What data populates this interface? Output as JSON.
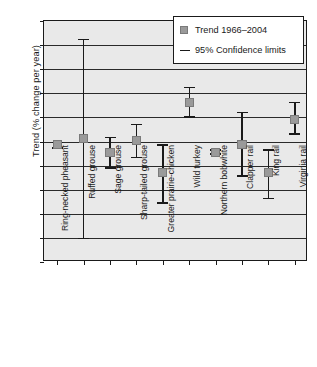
{
  "chart_data": {
    "type": "scatter",
    "title": "",
    "xlabel": "",
    "ylabel": "Trend (% change per year)",
    "ylim": [
      -25,
      25
    ],
    "ytick_step": 5,
    "yticks": [
      "25",
      "20",
      "15",
      "10",
      "5",
      "0",
      "−5",
      "−10",
      "−15",
      "−20",
      "−25"
    ],
    "grid": true,
    "legend_position": "top-right",
    "legend": [
      {
        "label": "Trend 1966–2004",
        "marker": "square",
        "color": "#9a9a9a"
      },
      {
        "label": "95% Confidence limits",
        "marker": "line",
        "color": "#1a1a1a"
      }
    ],
    "categories": [
      "Ring-necked pheasant",
      "Ruffed grouse",
      "Sage grouse",
      "Sharp-tailed grouse",
      "Greater prairie-chicken",
      "Wild turkey",
      "Northern bobwhite",
      "Clapper rail",
      "King rail",
      "Virginia rail"
    ],
    "series": [
      {
        "name": "Trend 1966–2004",
        "values": [
          -0.7,
          0.7,
          -2.3,
          0.2,
          -6.5,
          8.1,
          -2.2,
          -0.7,
          -6.5,
          4.6
        ],
        "ci_lower": [
          -1.3,
          -20.1,
          -5.5,
          -3.3,
          -12.8,
          5.1,
          -2.6,
          -7.2,
          -11.8,
          1.5
        ],
        "ci_upper": [
          -0.2,
          21.2,
          0.8,
          3.5,
          -0.7,
          11.2,
          -1.8,
          6.0,
          -1.8,
          8.1
        ]
      }
    ]
  },
  "colors": {
    "marker": "#9a9a9a",
    "marker_border": "#7a7a7a",
    "line": "#1a1a1a",
    "plot_background": "#e9e9e9",
    "figure_background": "#ffffff",
    "grid": "#2a2a2a"
  }
}
